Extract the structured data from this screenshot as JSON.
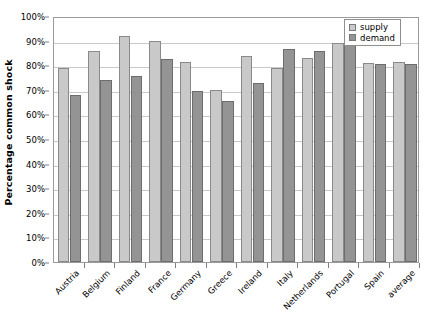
{
  "chart_data": {
    "type": "bar",
    "title": "",
    "xlabel": "",
    "ylabel": "Percentage common shock",
    "ylim": [
      0,
      100
    ],
    "grid": true,
    "legend_position": "top-right",
    "categories": [
      "Austria",
      "Belgium",
      "Finland",
      "France",
      "Germany",
      "Greece",
      "Ireland",
      "Italy",
      "Netherlands",
      "Portugal",
      "Spain",
      "average"
    ],
    "y_ticks": [
      "0%",
      "10%",
      "20%",
      "30%",
      "40%",
      "50%",
      "60%",
      "70%",
      "80%",
      "90%",
      "100%"
    ],
    "y_tick_values": [
      0,
      10,
      20,
      30,
      40,
      50,
      60,
      70,
      80,
      90,
      100
    ],
    "series": [
      {
        "name": "supply",
        "color": "#c9c9c9",
        "values": [
          78.8,
          85.6,
          91.7,
          89.8,
          81.3,
          69.9,
          83.7,
          78.9,
          83.0,
          88.9,
          80.7,
          81.5
        ]
      },
      {
        "name": "demand",
        "color": "#949494",
        "values": [
          68.0,
          74.1,
          75.8,
          82.7,
          69.5,
          65.3,
          72.8,
          86.4,
          85.6,
          93.0,
          80.6,
          80.5
        ]
      }
    ]
  },
  "legend": {
    "items": [
      {
        "label": "supply"
      },
      {
        "label": "demand"
      }
    ]
  },
  "colors": {
    "supply": "#c9c9c9",
    "demand": "#949494",
    "gridline": "#c9c9c9",
    "axis": "#9a9a9a",
    "background": "#ffffff"
  }
}
